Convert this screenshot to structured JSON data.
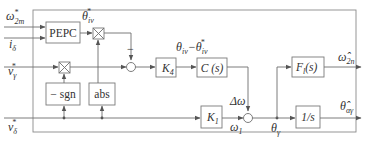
{
  "diagram": {
    "type": "control-block-diagram",
    "inputs": {
      "omega_2m_star": "ω*₂ₘ",
      "i_delta": "i_δ",
      "v_gamma_star": "v*_γ",
      "v_delta_star": "v*_δ"
    },
    "blocks": {
      "pepc": "PEPC",
      "neg_sgn": "− sgn",
      "abs": "abs",
      "k4": "K₄",
      "c_s": "C (s)",
      "k1": "K₁",
      "f_l": "F_l(s)",
      "integrator": "1/s"
    },
    "signals": {
      "theta_iv_star": "θ*_iv",
      "theta_err": "θ_iv − θ*_iv",
      "delta_omega": "Δω",
      "omega_1": "ω₁",
      "theta_gamma": "θ_γ",
      "minus_sign": "−"
    },
    "outputs": {
      "omega_2n_hat": "ω̂₂ₙ",
      "theta_alpha_gamma_hat": "θ̂_αγ"
    }
  }
}
